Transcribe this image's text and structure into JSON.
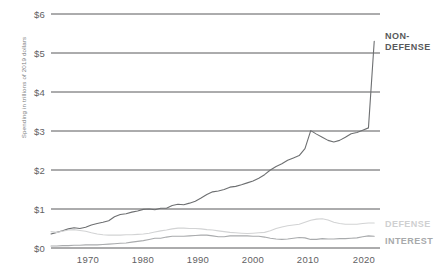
{
  "chart_data": {
    "type": "line",
    "title": "",
    "xlabel": "",
    "ylabel": "Spending in trillions of 2019 dollars",
    "xlim": [
      1964,
      2021
    ],
    "ylim": [
      0,
      6
    ],
    "grid": true,
    "legend_position": "right-inline",
    "y_ticks": [
      "$0",
      "$1",
      "$2",
      "$3",
      "$4",
      "$5",
      "$6"
    ],
    "y_tick_values": [
      0,
      1,
      2,
      3,
      4,
      5,
      6
    ],
    "x_ticks": [
      "1970",
      "1980",
      "1990",
      "2000",
      "2010",
      "2020"
    ],
    "x_tick_values": [
      1970,
      1980,
      1990,
      2000,
      2010,
      2020
    ],
    "colors": {
      "non_defense": "#6d6f71",
      "defense": "#d2d3d4",
      "interest": "#a9abad",
      "gridline": "#58595b",
      "text": "#5f6163"
    },
    "x": [
      1964,
      1965,
      1966,
      1967,
      1968,
      1969,
      1970,
      1971,
      1972,
      1973,
      1974,
      1975,
      1976,
      1977,
      1978,
      1979,
      1980,
      1981,
      1982,
      1983,
      1984,
      1985,
      1986,
      1987,
      1988,
      1989,
      1990,
      1991,
      1992,
      1993,
      1994,
      1995,
      1996,
      1997,
      1998,
      1999,
      2000,
      2001,
      2002,
      2003,
      2004,
      2005,
      2006,
      2007,
      2008,
      2009,
      2010,
      2011,
      2012,
      2013,
      2014,
      2015,
      2016,
      2017,
      2018,
      2019,
      2020
    ],
    "series": [
      {
        "name": "NON-DEFENSE",
        "label": "NON-\nDEFENSE",
        "color": "#6d6f71",
        "values": [
          0.36,
          0.4,
          0.44,
          0.49,
          0.52,
          0.5,
          0.53,
          0.59,
          0.63,
          0.66,
          0.7,
          0.8,
          0.86,
          0.88,
          0.92,
          0.95,
          0.99,
          1.0,
          0.98,
          1.02,
          1.02,
          1.09,
          1.12,
          1.11,
          1.15,
          1.2,
          1.28,
          1.37,
          1.44,
          1.46,
          1.5,
          1.56,
          1.58,
          1.62,
          1.67,
          1.72,
          1.79,
          1.88,
          2.0,
          2.09,
          2.16,
          2.25,
          2.31,
          2.37,
          2.55,
          3.01,
          2.92,
          2.84,
          2.76,
          2.72,
          2.76,
          2.84,
          2.93,
          2.96,
          3.02,
          3.08,
          5.3
        ]
      },
      {
        "name": "DEFENSE",
        "label": "DEFENSE",
        "color": "#d2d3d4",
        "values": [
          0.42,
          0.4,
          0.43,
          0.46,
          0.47,
          0.45,
          0.43,
          0.39,
          0.36,
          0.34,
          0.33,
          0.33,
          0.33,
          0.34,
          0.34,
          0.35,
          0.36,
          0.38,
          0.41,
          0.44,
          0.46,
          0.49,
          0.51,
          0.51,
          0.5,
          0.5,
          0.49,
          0.47,
          0.46,
          0.44,
          0.42,
          0.4,
          0.39,
          0.38,
          0.37,
          0.38,
          0.39,
          0.4,
          0.44,
          0.5,
          0.54,
          0.57,
          0.59,
          0.61,
          0.66,
          0.71,
          0.74,
          0.75,
          0.72,
          0.66,
          0.63,
          0.61,
          0.61,
          0.61,
          0.63,
          0.64,
          0.64
        ]
      },
      {
        "name": "INTEREST",
        "label": "INTEREST",
        "color": "#a9abad",
        "values": [
          0.05,
          0.05,
          0.06,
          0.06,
          0.07,
          0.07,
          0.08,
          0.08,
          0.08,
          0.09,
          0.1,
          0.11,
          0.12,
          0.13,
          0.15,
          0.17,
          0.19,
          0.22,
          0.25,
          0.25,
          0.28,
          0.3,
          0.3,
          0.3,
          0.31,
          0.32,
          0.33,
          0.33,
          0.31,
          0.29,
          0.29,
          0.31,
          0.31,
          0.31,
          0.31,
          0.3,
          0.3,
          0.28,
          0.25,
          0.23,
          0.22,
          0.23,
          0.25,
          0.27,
          0.26,
          0.22,
          0.22,
          0.24,
          0.23,
          0.23,
          0.24,
          0.24,
          0.25,
          0.26,
          0.29,
          0.31,
          0.3
        ]
      }
    ]
  }
}
